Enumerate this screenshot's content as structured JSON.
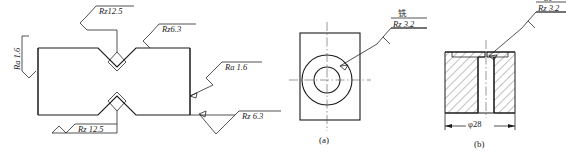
{
  "drawing": {
    "title": "Surface roughness symbol application example",
    "stroke_color": "#1a1a1a",
    "background": "#ffffff"
  },
  "figure_main": {
    "name": "notched-bar-part",
    "labels": {
      "left": "Ra 1.6",
      "top_notch": "Rz12.5",
      "top_right": "Rz6.3",
      "right_upper": "Ra 1.6",
      "right_lower": "Rz 6.3",
      "bottom_notch": "Rz 12.5"
    }
  },
  "figure_a": {
    "caption": "(a)",
    "name": "flange-front-view",
    "callout": {
      "process": "铣",
      "roughness": "Rz 3.2"
    }
  },
  "figure_b": {
    "caption": "(b)",
    "name": "flange-section-view",
    "callout": {
      "process": "铣",
      "roughness": "Rz 3.2"
    },
    "dimension": "φ28"
  }
}
